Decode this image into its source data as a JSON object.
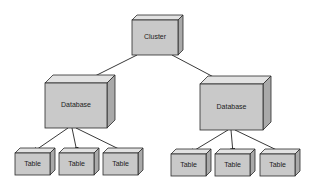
{
  "diagram": {
    "nodes": [
      {
        "id": "cluster",
        "label": "Cluster",
        "x": 132,
        "y": 20,
        "w": 46,
        "h": 35,
        "d": 5
      },
      {
        "id": "db-left",
        "label": "Database",
        "x": 45,
        "y": 83,
        "w": 62,
        "h": 45,
        "d": 8
      },
      {
        "id": "db-right",
        "label": "Database",
        "x": 200,
        "y": 84,
        "w": 63,
        "h": 46,
        "d": 8
      },
      {
        "id": "table-l1",
        "label": "Table",
        "x": 15,
        "y": 153,
        "w": 35,
        "h": 22,
        "d": 5
      },
      {
        "id": "table-l2",
        "label": "Table",
        "x": 59,
        "y": 153,
        "w": 35,
        "h": 22,
        "d": 5
      },
      {
        "id": "table-l3",
        "label": "Table",
        "x": 103,
        "y": 153,
        "w": 35,
        "h": 22,
        "d": 5
      },
      {
        "id": "table-r1",
        "label": "Table",
        "x": 171,
        "y": 154,
        "w": 35,
        "h": 22,
        "d": 5
      },
      {
        "id": "table-r2",
        "label": "Table",
        "x": 215,
        "y": 154,
        "w": 35,
        "h": 22,
        "d": 5
      },
      {
        "id": "table-r3",
        "label": "Table",
        "x": 260,
        "y": 154,
        "w": 35,
        "h": 22,
        "d": 5
      }
    ],
    "edges": [
      {
        "from": "cluster",
        "to": "db-left",
        "x1": 137,
        "y1": 55,
        "x2": 85,
        "y2": 81
      },
      {
        "from": "cluster",
        "to": "db-right",
        "x1": 172,
        "y1": 55,
        "x2": 223,
        "y2": 82
      },
      {
        "from": "db-left",
        "to": "table-l1",
        "x1": 68,
        "y1": 128,
        "x2": 33,
        "y2": 152
      },
      {
        "from": "db-left",
        "to": "table-l2",
        "x1": 72,
        "y1": 128,
        "x2": 77,
        "y2": 152
      },
      {
        "from": "db-left",
        "to": "table-l3",
        "x1": 76,
        "y1": 128,
        "x2": 125,
        "y2": 152
      },
      {
        "from": "db-right",
        "to": "table-r1",
        "x1": 228,
        "y1": 130,
        "x2": 190,
        "y2": 153
      },
      {
        "from": "db-right",
        "to": "table-r2",
        "x1": 231,
        "y1": 130,
        "x2": 233,
        "y2": 153
      },
      {
        "from": "db-right",
        "to": "table-r3",
        "x1": 235,
        "y1": 130,
        "x2": 283,
        "y2": 153
      }
    ]
  }
}
